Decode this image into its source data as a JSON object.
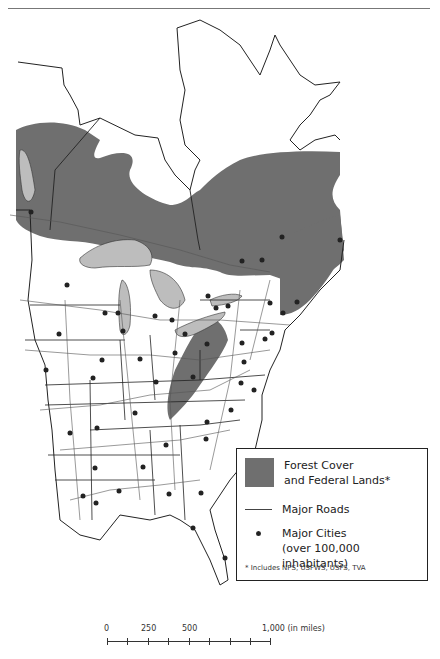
{
  "map": {
    "region": "Eastern North America",
    "colors": {
      "forest": "#6f6f6f",
      "water": "#bdbdbd",
      "land": "#ffffff",
      "border": "#222222",
      "road": "#555555",
      "city": "#222222"
    }
  },
  "legend": {
    "items": [
      {
        "type": "swatch",
        "label_line1": "Forest Cover",
        "label_line2": "and Federal Lands*"
      },
      {
        "type": "line",
        "label_line1": "Major Roads"
      },
      {
        "type": "dot",
        "label_line1": "Major Cities",
        "label_line2": "(over 100,000 inhabitants)"
      }
    ],
    "footnote": "* Includes NPS, USFWS, USFS, TVA"
  },
  "scale_bar": {
    "labels": [
      "0",
      "250",
      "500",
      "1,000 (in miles)"
    ],
    "units": "miles"
  }
}
